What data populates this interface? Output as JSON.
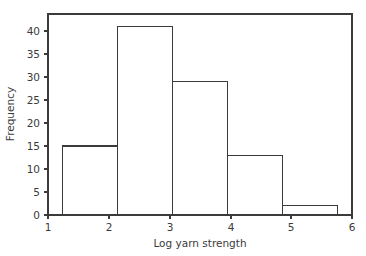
{
  "chart_data": {
    "type": "bar",
    "title": "",
    "subtitle": "",
    "xlabel": "Log yarn strength",
    "ylabel": "Frequency",
    "xlim": [
      0.92,
      6.0
    ],
    "ylim": [
      0,
      43.7
    ],
    "xticks": [
      1,
      2,
      3,
      4,
      5,
      6
    ],
    "xticklabels": [
      "1",
      "2",
      "3",
      "4",
      "5",
      "6"
    ],
    "yticks": [
      0,
      5,
      10,
      15,
      20,
      25,
      30,
      35,
      40
    ],
    "yticklabels": [
      "0",
      "5",
      "10",
      "15",
      "20",
      "25",
      "30",
      "35",
      "40"
    ],
    "grid": false,
    "legend": null,
    "bin_edges": [
      1.16,
      2.08,
      3.0,
      3.92,
      4.84,
      5.76
    ],
    "categories": [
      "1.16-2.08",
      "2.08-3.00",
      "3.00-3.92",
      "3.92-4.84",
      "4.84-5.76"
    ],
    "values": [
      15,
      41,
      29,
      13,
      2
    ],
    "series": [
      {
        "name": "Frequency",
        "values": [
          15,
          41,
          29,
          13,
          2
        ]
      }
    ],
    "bar_style": {
      "fill": "none",
      "edge_color": "#3b3b3b"
    },
    "annotations": []
  },
  "figure": {
    "background_color": "#ffffff",
    "line_color": "#3b3b3b"
  }
}
